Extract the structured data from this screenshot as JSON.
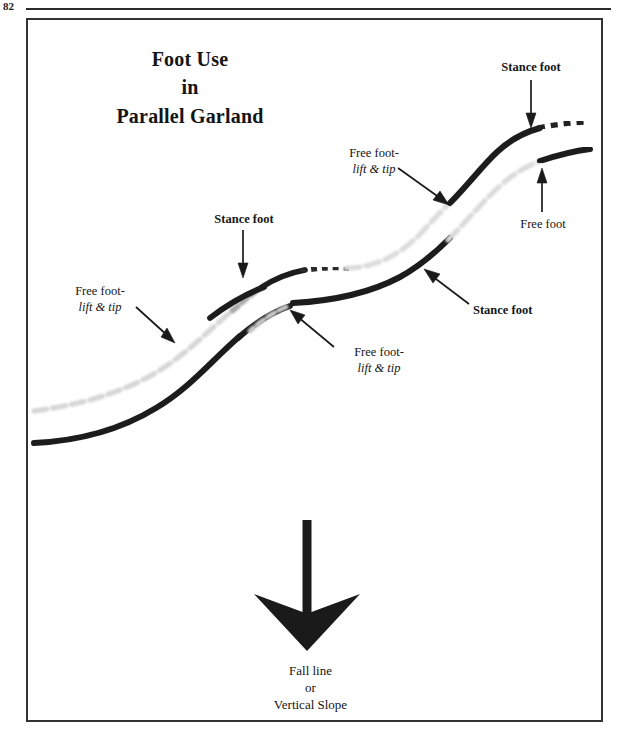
{
  "page": {
    "number": "82",
    "header_rule": true,
    "frame_border_color": "#333333",
    "background": "#ffffff"
  },
  "figure": {
    "title": {
      "line1": "Foot Use",
      "line2": "in",
      "line3": "Parallel Garland"
    },
    "caption": {
      "line1": "Fall line",
      "line2": "or",
      "line3": "Vertical Slope"
    }
  },
  "annotations": [
    {
      "id": "free-foot-lift-tip-left",
      "line1": "Free foot-",
      "line2": "lift & tip",
      "style": "roman-then-italic",
      "align": "center",
      "x": 55,
      "y": 284,
      "arrow": {
        "x1": 138,
        "y1": 310,
        "x2": 173,
        "y2": 340
      }
    },
    {
      "id": "stance-foot-left",
      "line1": "Stance foot",
      "style": "bold",
      "align": "center",
      "x": 206,
      "y": 212,
      "arrow": {
        "x1": 243,
        "y1": 231,
        "x2": 243,
        "y2": 275
      }
    },
    {
      "id": "free-foot-lift-tip-middle",
      "line1": "Free foot-",
      "line2": "lift & tip",
      "style": "roman-then-italic",
      "align": "left",
      "x": 337,
      "y": 348,
      "arrow": {
        "x1": 332,
        "y1": 345,
        "x2": 290,
        "y2": 309
      }
    },
    {
      "id": "free-foot-lift-tip-upper",
      "line1": "Free foot-",
      "line2": "lift & tip",
      "style": "roman-then-italic",
      "align": "center",
      "x": 330,
      "y": 148,
      "arrow": {
        "x1": 400,
        "y1": 170,
        "x2": 447,
        "y2": 204
      }
    },
    {
      "id": "stance-foot-top-right",
      "line1": "Stance foot",
      "style": "bold",
      "align": "center",
      "x": 497,
      "y": 61,
      "arrow": {
        "x1": 531,
        "y1": 80,
        "x2": 531,
        "y2": 124
      }
    },
    {
      "id": "free-foot-right",
      "line1": "Free foot",
      "style": "roman",
      "align": "center",
      "x": 512,
      "y": 218,
      "arrow": {
        "x1": 542,
        "y1": 212,
        "x2": 542,
        "y2": 170
      }
    },
    {
      "id": "stance-foot-right",
      "line1": "Stance foot",
      "style": "bold",
      "align": "left",
      "x": 472,
      "y": 305,
      "arrow": {
        "x1": 467,
        "y1": 302,
        "x2": 424,
        "y2": 268
      }
    }
  ],
  "diagram": {
    "fall_line_arrow": {
      "shaft_top_y": 520,
      "tip_y": 651,
      "center_x": 307,
      "color": "#1a1a1a"
    },
    "tracks": {
      "description": "Two parallel sinuous ski tracks running lower-left to upper-right; each alternates between a solid dark segment (weighted / stance foot) and a pale dashed segment (unweighted / free foot), swapping at each turn.",
      "dark_color": "#1d1d1d",
      "light_color": "#d8d8d8",
      "count": 2
    }
  }
}
